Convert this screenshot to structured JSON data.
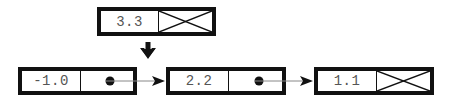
{
  "diagram": {
    "type": "linked-list-insertion",
    "colors": {
      "border": "#111111",
      "text": "#555555",
      "link_line": "#888888",
      "background": "#ffffff"
    },
    "new_node": {
      "value": "3.3",
      "pointer": "null"
    },
    "insert_arrow": {
      "direction": "down",
      "icon": "arrow-down-icon"
    },
    "list": [
      {
        "value": "-1.0",
        "pointer": "next"
      },
      {
        "value": "2.2",
        "pointer": "next"
      },
      {
        "value": "1.1",
        "pointer": "null"
      }
    ]
  }
}
